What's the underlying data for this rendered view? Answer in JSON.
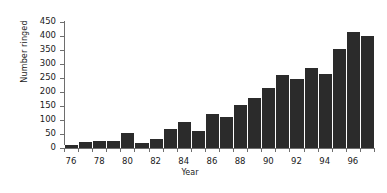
{
  "chart_data": {
    "type": "bar",
    "title": "",
    "xlabel": "Year",
    "ylabel": "Number ringed",
    "categories": [
      "76",
      "77",
      "78",
      "79",
      "80",
      "81",
      "82",
      "83",
      "84",
      "85",
      "86",
      "87",
      "88",
      "89",
      "90",
      "91",
      "92",
      "93",
      "94",
      "95",
      "96",
      "97"
    ],
    "values": [
      10,
      22,
      25,
      25,
      55,
      18,
      33,
      68,
      92,
      60,
      120,
      110,
      155,
      180,
      215,
      260,
      245,
      285,
      265,
      355,
      415,
      400
    ],
    "ylim": [
      0,
      450
    ],
    "ytick_values": [
      0,
      50,
      100,
      150,
      200,
      250,
      300,
      350,
      400,
      450
    ],
    "ytick_labels": [
      "0",
      "50",
      "100",
      "150",
      "200",
      "250",
      "300",
      "350",
      "400",
      "450"
    ],
    "xtick_labels": [
      "76",
      "78",
      "80",
      "82",
      "84",
      "86",
      "88",
      "90",
      "92",
      "94",
      "96"
    ],
    "xtick_categories": [
      "76",
      "78",
      "80",
      "82",
      "84",
      "86",
      "88",
      "90",
      "92",
      "94",
      "96"
    ],
    "grid": false,
    "legend": null,
    "bar_color": "#2b2b2b",
    "axis_color": "#6e6e6e"
  }
}
